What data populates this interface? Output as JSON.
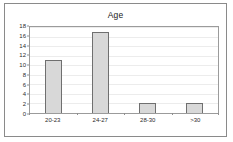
{
  "chart_data": {
    "type": "bar",
    "title": "Age",
    "xlabel": "",
    "ylabel": "",
    "categories": [
      "20-23",
      "24-27",
      "28-30",
      ">30"
    ],
    "values": [
      11,
      17,
      2,
      2
    ],
    "ylim": [
      0,
      18
    ],
    "yticks": [
      18,
      16,
      14,
      12,
      10,
      8,
      6,
      4,
      2,
      0
    ],
    "grid": true,
    "legend": false,
    "legend_position": "none",
    "series": [
      {
        "name": "Age",
        "values": [
          11,
          17,
          2,
          2
        ]
      }
    ],
    "colors": {
      "bar_fill": "#d8d8d8",
      "bar_border": "#6f6f6f",
      "gridline": "#ececec",
      "plot_border": "#9b9b9b",
      "frame_border": "#8a8a8a",
      "text": "#2b2b2b",
      "background": "#ffffff"
    }
  }
}
